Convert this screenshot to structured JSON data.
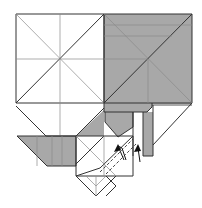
{
  "diagram": {
    "title": "",
    "type": "origami-fold-diagram",
    "width": 202,
    "height": 208,
    "colors": {
      "background": "#ffffff",
      "paper_white": "#ffffff",
      "paper_gray": "#a8a8a8",
      "paper_gray_dark": "#9a9a9a",
      "line": "#333333",
      "crease": "#8a8a8a",
      "arrow": "#111111"
    },
    "fills": [
      {
        "name": "left-square",
        "color": "#ffffff",
        "points": "16,14 104,14 104,103 16,103"
      },
      {
        "name": "right-square-colored",
        "color": "#a8a8a8",
        "points": "104,14 192,14 192,103 104,103"
      },
      {
        "name": "left-lower-flap-white",
        "color": "#ffffff",
        "points": "16,103 104,103 104,106 76,136 46,136"
      },
      {
        "name": "left-gray-strip",
        "color": "#a8a8a8",
        "points": "17,136 76,136 76,166 47,166"
      },
      {
        "name": "center-gray-triangle",
        "color": "#a8a8a8",
        "points": "104,110 104,136 76,136"
      },
      {
        "name": "center-top-gray-band",
        "color": "#a8a8a8",
        "points": "104,103 152,103 152,107 147,112 104,112"
      },
      {
        "name": "right-band-gray",
        "color": "#a8a8a8",
        "points": "147,103 192,103 192,106 147,106"
      },
      {
        "name": "center-inner-gray",
        "color": "#a8a8a8",
        "points": "105,112 133,112 133,127 118,137 105,122"
      },
      {
        "name": "right-vertical-strip-gray",
        "color": "#a8a8a8",
        "points": "143,112 153,112 153,156 143,156"
      },
      {
        "name": "white-column",
        "color": "#ffffff",
        "points": "133,112 143,112 143,156 133,156"
      },
      {
        "name": "front-square-white",
        "color": "#ffffff",
        "points": "76,136 133,136 133,176 76,176"
      },
      {
        "name": "bottom-point-white",
        "color": "#ffffff",
        "points": "76,176 116,176 96,196"
      }
    ],
    "lines": [
      {
        "name": "left-square-outline",
        "style": "solid",
        "d": "M16 14 H104 V103 H16 Z"
      },
      {
        "name": "left-diag-1",
        "style": "crease",
        "d": "M16 14 L104 103"
      },
      {
        "name": "left-diag-2",
        "style": "solid",
        "d": "M16 103 L104 14"
      },
      {
        "name": "left-vert-mid",
        "style": "crease",
        "d": "M60 14 V103"
      },
      {
        "name": "left-horiz-mid",
        "style": "crease",
        "d": "M16 59 H104"
      },
      {
        "name": "right-square-outline",
        "style": "solid",
        "d": "M104 14 H192 V103 H104 Z"
      },
      {
        "name": "right-diag-1",
        "style": "crease",
        "d": "M104 14 L192 103"
      },
      {
        "name": "right-diag-2",
        "style": "solid",
        "d": "M104 103 L192 14"
      },
      {
        "name": "right-horiz-1",
        "style": "crease",
        "d": "M104 25 H192"
      },
      {
        "name": "right-horiz-2",
        "style": "crease",
        "d": "M104 36 H172"
      },
      {
        "name": "right-horiz-mid",
        "style": "crease",
        "d": "M104 59 H148"
      },
      {
        "name": "right-vert-mid",
        "style": "crease",
        "d": "M148 59 V103"
      },
      {
        "name": "left-lower-flap",
        "style": "solid",
        "d": "M16 106 L46 136 H76"
      },
      {
        "name": "left-lower-flap-vert",
        "style": "crease",
        "d": "M60 103 V136"
      },
      {
        "name": "left-strip",
        "style": "solid",
        "d": "M17 136 H76 V166 H47 Z"
      },
      {
        "name": "left-strip-creases",
        "style": "crease",
        "d": "M37 136 V166 M52 136 V166 M62 136 V166"
      },
      {
        "name": "center-triangle-edge",
        "style": "solid",
        "d": "M76 136 L104 108"
      },
      {
        "name": "center-top-band",
        "style": "solid",
        "d": "M104 103 V112 H147 L152 107 V103"
      },
      {
        "name": "inner-gray-box",
        "style": "solid",
        "d": "M105 112 V122 L118 137 L133 127 V112"
      },
      {
        "name": "white-column-edges",
        "style": "solid",
        "d": "M133 112 V156 M143 112 V156 M153 105 V156 H143"
      },
      {
        "name": "right-diagonal-to-strip",
        "style": "solid",
        "d": "M192 103 L153 145"
      },
      {
        "name": "front-square",
        "style": "solid",
        "d": "M76 136 H133 V176 H76 Z"
      },
      {
        "name": "front-square-x1",
        "style": "crease",
        "d": "M76 136 L116 176"
      },
      {
        "name": "front-square-x2",
        "style": "solid",
        "d": "M104 136 L76 164"
      },
      {
        "name": "front-square-diag-long",
        "style": "solid",
        "d": "M133 136 L100 168 L76 176"
      },
      {
        "name": "front-square-vert",
        "style": "crease",
        "d": "M104 136 V176"
      },
      {
        "name": "bottom-point",
        "style": "solid",
        "d": "M76 176 L96 196 L116 176"
      },
      {
        "name": "bottom-point-inner",
        "style": "crease",
        "d": "M86 176 L96 186 M96 176 V196 M106 176 L96 186"
      },
      {
        "name": "bottom-point-side",
        "style": "solid",
        "d": "M106 176 L116 186 L106 196"
      },
      {
        "name": "valley-fold-dashed-1",
        "style": "dashed",
        "d": "M100 172 L133 139"
      },
      {
        "name": "valley-fold-dashed-2",
        "style": "dashed",
        "d": "M106 174 L136 144"
      }
    ],
    "arrows": [
      {
        "name": "fold-arrow-1",
        "d": "M124 160 L118 146 L122 148 L126 160",
        "head": "118,144 114,152 121,150"
      },
      {
        "name": "fold-arrow-2",
        "d": "M140 162 L138 148",
        "head": "138,144 134,152 141,151"
      }
    ]
  }
}
